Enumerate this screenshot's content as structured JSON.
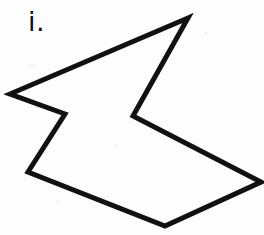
{
  "figure": {
    "label": "i.",
    "caption_text": "i.",
    "background_color": "#fdfdfd",
    "stroke_color": "#111111",
    "stroke_width": 5,
    "canvas": {
      "width": 264,
      "height": 235
    },
    "shape": {
      "name": "irregular-heptagon",
      "type": "closed-polygon",
      "fill": "none",
      "vertex_count": 7,
      "vertices": [
        {
          "name": "top-apex",
          "x": 188,
          "y": 18
        },
        {
          "name": "left-point",
          "x": 10,
          "y": 94
        },
        {
          "name": "upper-notch",
          "x": 65,
          "y": 114
        },
        {
          "name": "lower-left",
          "x": 28,
          "y": 172
        },
        {
          "name": "bottom-point",
          "x": 165,
          "y": 226
        },
        {
          "name": "right-point",
          "x": 261,
          "y": 182
        },
        {
          "name": "inner-notch",
          "x": 133,
          "y": 116
        }
      ],
      "points_attr": "188,18 10,94 65,114 28,172 165,226 261,182 133,116"
    }
  }
}
